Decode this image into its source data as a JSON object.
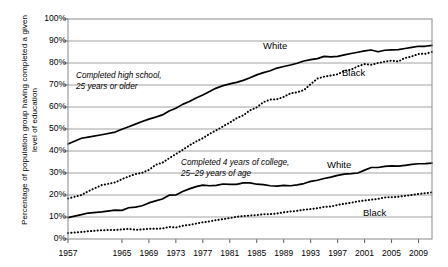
{
  "chart_data": {
    "type": "line",
    "title": "",
    "xlabel": "",
    "ylabel": "Percentage of population group having completed a given level of education",
    "xlim": [
      1957,
      2011
    ],
    "ylim": [
      0,
      100
    ],
    "grid": true,
    "legend_position": "inline-labels",
    "y_ticks": [
      "0%",
      "10%",
      "20%",
      "30%",
      "40%",
      "50%",
      "60%",
      "70%",
      "80%",
      "90%",
      "100%"
    ],
    "y_tick_values": [
      0,
      10,
      20,
      30,
      40,
      50,
      60,
      70,
      80,
      90,
      100
    ],
    "x_ticks": [
      "1957",
      "1965",
      "1969",
      "1973",
      "1977",
      "1981",
      "1985",
      "1989",
      "1993",
      "1997",
      "2001",
      "2005",
      "2009"
    ],
    "x_tick_values": [
      1957,
      1965,
      1969,
      1973,
      1977,
      1981,
      1985,
      1989,
      1993,
      1997,
      2001,
      2005,
      2009
    ],
    "annotations": [
      {
        "id": "hs-annot",
        "line1": "Completed high school,",
        "line2": "25 years or older"
      },
      {
        "id": "college-annot",
        "line1": "Completed 4 years of college,",
        "line2": "25–29 years of age"
      }
    ],
    "series": [
      {
        "name": "White",
        "group": "Completed high school, 25 years or older",
        "style": "solid",
        "color": "#000000",
        "label": "White",
        "x": [
          1957,
          1959,
          1960,
          1962,
          1964,
          1965,
          1966,
          1967,
          1968,
          1969,
          1970,
          1971,
          1972,
          1973,
          1974,
          1975,
          1976,
          1977,
          1978,
          1979,
          1980,
          1981,
          1982,
          1983,
          1984,
          1985,
          1986,
          1987,
          1988,
          1989,
          1990,
          1991,
          1992,
          1993,
          1994,
          1995,
          1996,
          1997,
          1998,
          1999,
          2000,
          2001,
          2002,
          2003,
          2004,
          2005,
          2006,
          2007,
          2008,
          2009,
          2010,
          2011
        ],
        "values": [
          43.2,
          45.8,
          46.3,
          47.4,
          48.6,
          49.9,
          51.0,
          52.2,
          53.4,
          54.5,
          55.4,
          56.4,
          58.2,
          59.4,
          61.2,
          62.5,
          64.1,
          65.5,
          67.0,
          68.6,
          69.7,
          70.5,
          71.2,
          72.1,
          73.3,
          74.6,
          75.6,
          76.5,
          77.7,
          78.4,
          79.1,
          79.9,
          80.9,
          81.5,
          82.0,
          83.0,
          82.8,
          83.0,
          83.7,
          84.3,
          84.9,
          85.5,
          85.9,
          85.1,
          85.8,
          86.0,
          86.1,
          86.6,
          87.1,
          87.6,
          87.6,
          88.0
        ]
      },
      {
        "name": "Black",
        "group": "Completed high school, 25 years or older",
        "style": "dotted",
        "color": "#000000",
        "label": "Black",
        "x": [
          1957,
          1959,
          1960,
          1962,
          1964,
          1965,
          1966,
          1967,
          1968,
          1969,
          1970,
          1971,
          1972,
          1973,
          1974,
          1975,
          1976,
          1977,
          1978,
          1979,
          1980,
          1981,
          1982,
          1983,
          1984,
          1985,
          1986,
          1987,
          1988,
          1989,
          1990,
          1991,
          1992,
          1993,
          1994,
          1995,
          1996,
          1997,
          1998,
          1999,
          2000,
          2001,
          2002,
          2003,
          2004,
          2005,
          2006,
          2007,
          2008,
          2009,
          2010,
          2011
        ],
        "values": [
          18.4,
          20.0,
          21.7,
          24.5,
          25.7,
          27.2,
          28.4,
          29.5,
          30.1,
          31.4,
          33.7,
          34.7,
          36.7,
          38.6,
          40.5,
          42.5,
          44.3,
          45.8,
          47.8,
          49.4,
          51.2,
          52.9,
          54.9,
          56.2,
          58.5,
          59.8,
          62.2,
          63.4,
          63.5,
          64.6,
          66.2,
          66.7,
          67.7,
          70.4,
          72.9,
          73.8,
          74.3,
          74.9,
          76.4,
          77.0,
          78.5,
          79.5,
          79.2,
          80.0,
          80.6,
          81.1,
          80.7,
          82.3,
          83.0,
          84.1,
          84.2,
          85.0
        ]
      },
      {
        "name": "White",
        "group": "Completed 4 years of college, 25–29 years of age",
        "style": "solid",
        "color": "#000000",
        "label": "White",
        "x": [
          1957,
          1959,
          1960,
          1962,
          1964,
          1965,
          1966,
          1967,
          1968,
          1969,
          1970,
          1971,
          1972,
          1973,
          1974,
          1975,
          1976,
          1977,
          1978,
          1979,
          1980,
          1981,
          1982,
          1983,
          1984,
          1985,
          1986,
          1987,
          1988,
          1989,
          1990,
          1991,
          1992,
          1993,
          1994,
          1995,
          1996,
          1997,
          1998,
          1999,
          2000,
          2001,
          2002,
          2003,
          2004,
          2005,
          2006,
          2007,
          2008,
          2009,
          2010,
          2011
        ],
        "values": [
          9.7,
          11.1,
          11.8,
          12.3,
          13.1,
          13.0,
          14.2,
          14.5,
          15.1,
          16.4,
          17.3,
          18.2,
          19.9,
          20.0,
          21.6,
          22.8,
          23.8,
          24.5,
          24.2,
          24.4,
          25.0,
          24.8,
          24.8,
          25.5,
          25.5,
          24.9,
          24.7,
          24.2,
          24.0,
          24.4,
          24.2,
          24.6,
          25.2,
          26.2,
          26.7,
          27.5,
          28.1,
          28.9,
          29.5,
          29.7,
          30.0,
          31.3,
          32.5,
          32.5,
          33.0,
          33.2,
          33.1,
          33.5,
          33.9,
          34.2,
          34.3,
          34.5
        ]
      },
      {
        "name": "Black",
        "group": "Completed 4 years of college, 25–29 years of age",
        "style": "dotted",
        "color": "#000000",
        "label": "Black",
        "x": [
          1957,
          1959,
          1960,
          1962,
          1964,
          1965,
          1966,
          1967,
          1968,
          1969,
          1970,
          1971,
          1972,
          1973,
          1974,
          1975,
          1976,
          1977,
          1978,
          1979,
          1980,
          1981,
          1982,
          1983,
          1984,
          1985,
          1986,
          1987,
          1988,
          1989,
          1990,
          1991,
          1992,
          1993,
          1994,
          1995,
          1996,
          1997,
          1998,
          1999,
          2000,
          2001,
          2002,
          2003,
          2004,
          2005,
          2006,
          2007,
          2008,
          2009,
          2010,
          2011
        ],
        "values": [
          2.7,
          3.2,
          3.5,
          4.0,
          4.1,
          4.3,
          4.6,
          4.2,
          4.3,
          4.7,
          4.6,
          4.8,
          5.5,
          5.2,
          6.0,
          6.4,
          7.0,
          7.6,
          8.0,
          8.6,
          9.0,
          9.5,
          10.1,
          10.4,
          10.7,
          10.9,
          11.2,
          11.3,
          11.6,
          12.1,
          12.5,
          12.8,
          13.3,
          13.6,
          14.0,
          14.6,
          14.8,
          15.5,
          16.0,
          16.5,
          17.1,
          17.5,
          17.9,
          18.2,
          18.9,
          19.0,
          19.2,
          19.6,
          20.0,
          20.5,
          20.8,
          21.2
        ]
      }
    ]
  }
}
